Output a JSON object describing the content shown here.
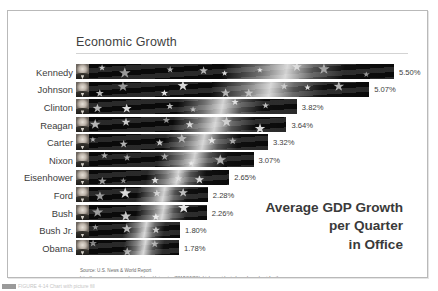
{
  "slide": {
    "title": "Economic Growth"
  },
  "callout": {
    "line1": "Average GDP Growth",
    "line2": "per Quarter",
    "line3": "in Office"
  },
  "source": {
    "line1": "Source: U.S. News & World Report",
    "line2": "http://www.usnews.com/news/blogs/data-mine/2015/10/28/which-presidents-have-been-best-for-the-economy"
  },
  "bottom_caption": {
    "text": "FIGURE 4-14 Chart with picture fill"
  },
  "colors": {
    "frame_border": "#b9b9b9",
    "title_text": "#3f3f3f",
    "title_rule": "#d3d3d3",
    "category_text": "#3c3c3c",
    "value_text": "#3d3d3d",
    "callout_text": "#3a3a3a",
    "source_text": "#6a6a6a",
    "bar_fill": "#0a0a0a",
    "background": "#ffffff"
  },
  "chart_data": {
    "type": "bar",
    "orientation": "horizontal",
    "title": "Economic Growth",
    "xlabel": "",
    "ylabel": "",
    "xlim": [
      0,
      5.5
    ],
    "grid": false,
    "legend": false,
    "data_labels": true,
    "fill_style": "picture-fill-grayscale-us-flag",
    "categories": [
      "Kennedy",
      "Johnson",
      "Clinton",
      "Reagan",
      "Carter",
      "Nixon",
      "Eisenhower",
      "Ford",
      "Bush",
      "Bush Jr.",
      "Obama"
    ],
    "values": [
      5.5,
      5.07,
      3.82,
      3.64,
      3.32,
      3.07,
      2.65,
      2.28,
      2.26,
      1.8,
      1.78
    ],
    "value_labels": [
      "5.50%",
      "5.07%",
      "3.82%",
      "3.64%",
      "3.32%",
      "3.07%",
      "2.65%",
      "2.28%",
      "2.26%",
      "1.80%",
      "1.78%"
    ]
  }
}
